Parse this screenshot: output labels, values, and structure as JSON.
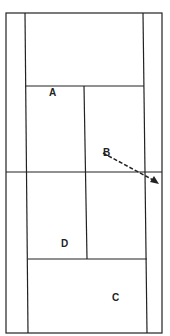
{
  "diagram": {
    "type": "tennis-court",
    "labels": {
      "a": "A",
      "b": "B",
      "c": "C",
      "d": "D"
    },
    "colors": {
      "line": "#222222",
      "background": "#ffffff"
    }
  }
}
